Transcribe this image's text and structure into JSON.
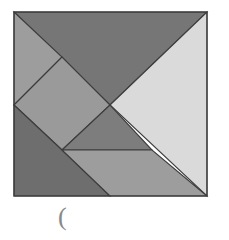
{
  "figure": {
    "background_color": "#ffffff",
    "outline_color": "#3c3c3c",
    "square": {
      "left": 14,
      "top": 12,
      "right": 207,
      "bottom": 196,
      "width": 193,
      "height": 184
    },
    "pieces": [
      {
        "name": "large-triangle-top",
        "shape": "triangle",
        "color": "#767676",
        "points": "14,12 207,12 110,105"
      },
      {
        "name": "large-triangle-right",
        "shape": "triangle",
        "color": "#dadada",
        "points": "110,105 207,12 207,196"
      },
      {
        "name": "small-triangle-upper-left",
        "shape": "triangle",
        "color": "#9d9d9d",
        "points": "14,12 62,57 14,105"
      },
      {
        "name": "square-center-left",
        "shape": "square",
        "color": "#9a9a9a",
        "points": "62,57 110,105 62,150 14,105"
      },
      {
        "name": "medium-triangle-center",
        "shape": "triangle",
        "color": "#7d7d7d",
        "points": "62,150 110,105 152,150"
      },
      {
        "name": "large-triangle-bottom-left",
        "shape": "triangle",
        "color": "#6e6e6e",
        "points": "14,105 62,150 110,196 14,196"
      },
      {
        "name": "parallelogram-bottom-right",
        "shape": "parallelogram",
        "color": "#9d9d9d",
        "points": "62,150 152,150 207,196 110,196"
      }
    ]
  },
  "caption": {
    "text": "(",
    "color": "#888888"
  }
}
